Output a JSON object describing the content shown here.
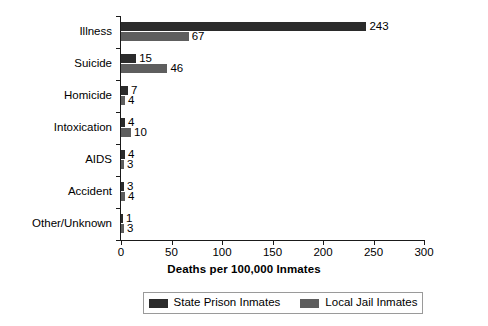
{
  "chart_data": {
    "type": "bar",
    "orientation": "horizontal",
    "title": "",
    "xlabel": "Deaths per 100,000 Inmates",
    "ylabel": "",
    "xlim": [
      0,
      300
    ],
    "xticks": [
      0,
      50,
      100,
      150,
      200,
      250,
      300
    ],
    "xtick_labels": [
      "0",
      "50",
      "100",
      "150",
      "200",
      "250",
      "300"
    ],
    "grid": false,
    "legend_position": "bottom-center",
    "categories": [
      "Illness",
      "Suicide",
      "Homicide",
      "Intoxication",
      "AIDS",
      "Accident",
      "Other/Unknown"
    ],
    "series": [
      {
        "name": "State Prison Inmates",
        "color": "#2b2b2b",
        "values": [
          243,
          15,
          7,
          4,
          4,
          3,
          1
        ]
      },
      {
        "name": "Local Jail Inmates",
        "color": "#5e5e5e",
        "values": [
          67,
          46,
          4,
          10,
          3,
          4,
          3
        ]
      }
    ],
    "value_labels": {
      "Illness": [
        "243",
        "67"
      ],
      "Suicide": [
        "15",
        "46"
      ],
      "Homicide": [
        "7",
        "4"
      ],
      "Intoxication": [
        "4",
        "10"
      ],
      "AIDS": [
        "4",
        "3"
      ],
      "Accident": [
        "3",
        "4"
      ],
      "Other/Unknown": [
        "1",
        "3"
      ]
    }
  },
  "legend": {
    "entries": [
      {
        "label": "State Prison Inmates",
        "swatch": "prison"
      },
      {
        "label": "Local Jail Inmates",
        "swatch": "jail"
      }
    ]
  },
  "colors": {
    "state_prison": "#2b2b2b",
    "local_jail": "#5e5e5e",
    "axis": "#1a1a1a",
    "background": "#ffffff"
  }
}
